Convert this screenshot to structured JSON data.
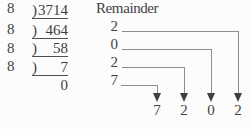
{
  "colors": {
    "text": "#3f3f3f",
    "underline": "#4f4f4f",
    "connector_line": "#8e8e8e",
    "background": "#fcfcfc"
  },
  "remainder_header": "Remainder",
  "division": {
    "rows": [
      {
        "divisor": "8",
        "bracket": ")",
        "value": "3714"
      },
      {
        "divisor": "8",
        "bracket": ")",
        "value": "464"
      },
      {
        "divisor": "8",
        "bracket": ")",
        "value": "58"
      },
      {
        "divisor": "8",
        "bracket": ")",
        "value": "7"
      },
      {
        "divisor": "",
        "bracket": "",
        "value": "0"
      }
    ]
  },
  "remainders": [
    "2",
    "0",
    "2",
    "7"
  ],
  "answer_digits": [
    "7",
    "2",
    "0",
    "2"
  ]
}
